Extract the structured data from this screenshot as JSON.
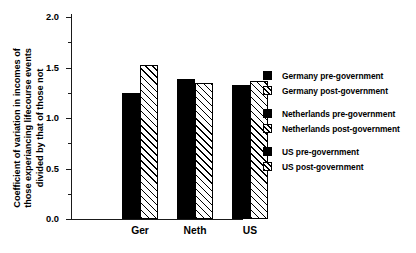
{
  "chart_data": {
    "type": "bar",
    "title": "",
    "xlabel": "",
    "ylabel": "Coefficient of variation in incomes of those experiancing lifecourse events divided by that of those not",
    "ylabel_lines": [
      "Coefficient of variation in incomes of",
      "those experiancing lifecourse events",
      "divided by that of those not"
    ],
    "categories": [
      "Ger",
      "Neth",
      "US"
    ],
    "ylim": [
      0.0,
      2.0
    ],
    "ytick_labels": [
      "0.0",
      "0.5",
      "1.0",
      "1.5",
      "2.0"
    ],
    "ytick_values": [
      0.0,
      0.5,
      1.0,
      1.5,
      2.0
    ],
    "yminor_values": [
      0.25,
      0.75,
      1.25,
      1.75
    ],
    "grid": false,
    "legend_position": "right",
    "series": [
      {
        "name": "pre-government",
        "style": "solid",
        "values": [
          1.25,
          1.39,
          1.33
        ]
      },
      {
        "name": "post-government",
        "style": "hatched",
        "values": [
          1.52,
          1.35,
          1.37
        ]
      }
    ],
    "bars": [
      {
        "category": "Ger",
        "series": "pre-government",
        "value": 1.25,
        "style": "solid"
      },
      {
        "category": "Ger",
        "series": "post-government",
        "value": 1.52,
        "style": "hatched"
      },
      {
        "category": "Neth",
        "series": "pre-government",
        "value": 1.39,
        "style": "solid"
      },
      {
        "category": "Neth",
        "series": "post-government",
        "value": 1.35,
        "style": "hatched"
      },
      {
        "category": "US",
        "series": "pre-government",
        "value": 1.33,
        "style": "solid"
      },
      {
        "category": "US",
        "series": "post-government",
        "value": 1.37,
        "style": "hatched"
      }
    ],
    "legend_groups": [
      {
        "entries": [
          {
            "label": "Germany pre-government",
            "style": "solid"
          },
          {
            "label": "Germany post-government",
            "style": "hatched"
          }
        ]
      },
      {
        "entries": [
          {
            "label": "Netherlands pre-government",
            "style": "solid"
          },
          {
            "label": "Netherlands post-government",
            "style": "hatched"
          }
        ]
      },
      {
        "entries": [
          {
            "label": "US pre-government",
            "style": "solid"
          },
          {
            "label": "US post-government",
            "style": "hatched"
          }
        ]
      }
    ],
    "colors": {
      "solid_fill": "#000000",
      "hatched_fill": "#ffffff",
      "hatch_line": "#000000",
      "axis": "#1a1a1a",
      "background": "#ffffff",
      "text": "#000000"
    }
  }
}
